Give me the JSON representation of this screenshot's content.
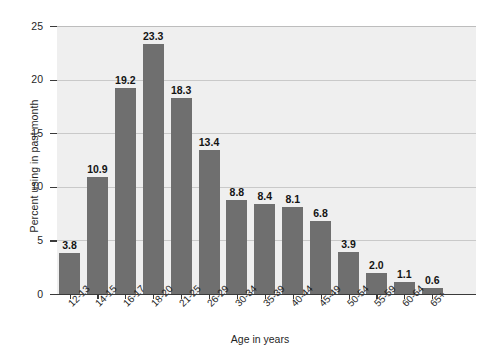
{
  "chart_data": {
    "type": "bar",
    "title": "",
    "subtitle": "",
    "xlabel": "Age in years",
    "ylabel": "Percent using in past month",
    "categories": [
      "12-13",
      "14-15",
      "16-17",
      "18-20",
      "21-25",
      "26-29",
      "30-34",
      "35-39",
      "40-44",
      "45-49",
      "50-54",
      "55-59",
      "60-64",
      "65+"
    ],
    "values": [
      3.8,
      10.9,
      19.2,
      23.3,
      18.3,
      13.4,
      8.8,
      8.4,
      8.1,
      6.8,
      3.9,
      2.0,
      1.1,
      0.6
    ],
    "value_labels": [
      "3.8",
      "10.9",
      "19.2",
      "23.3",
      "18.3",
      "13.4",
      "8.8",
      "8.4",
      "8.1",
      "6.8",
      "3.9",
      "2.0",
      "1.1",
      "0.6"
    ],
    "ylim": [
      0,
      25
    ],
    "yticks": [
      0,
      5,
      10,
      15,
      20,
      25
    ],
    "ytick_labels": [
      "0",
      "5",
      "10",
      "15",
      "20",
      "25"
    ],
    "grid": true,
    "grid_axis": "y",
    "legend": false,
    "legend_position": "none",
    "bar_color": "#6f6f6f",
    "plot_background": "#efefef",
    "figure_background": "#ffffff",
    "axis_color": "#3a3a3a",
    "gridline_color": "#c9c9c9"
  }
}
